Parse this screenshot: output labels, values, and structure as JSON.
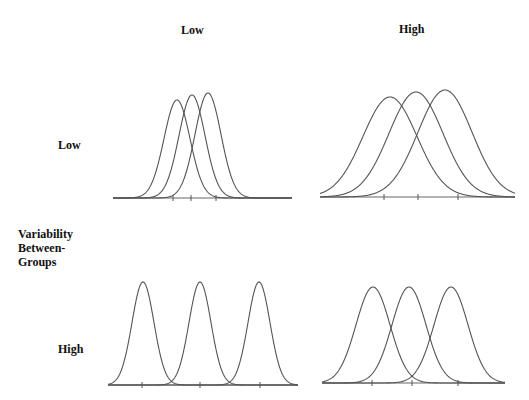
{
  "column_header": {
    "title": "Variability Within-Groups (implied)",
    "low": "Low",
    "high": "High"
  },
  "row_header": {
    "title_lines": [
      "Variability",
      "Between-",
      "Groups"
    ],
    "low": "Low",
    "high": "High"
  },
  "panels": [
    {
      "id": "low-between-low-within",
      "row": "Low",
      "col": "Low",
      "baseline_y": 198,
      "x_range": [
        113,
        292
      ],
      "peak_y": [
        100,
        95,
        93
      ],
      "means": [
        177,
        192,
        208
      ],
      "sigma": 13,
      "ticks": [
        173,
        191,
        216
      ]
    },
    {
      "id": "low-between-high-within",
      "row": "Low",
      "col": "High",
      "baseline_y": 197,
      "x_range": [
        320,
        515
      ],
      "peak_y": [
        97,
        92,
        90
      ],
      "means": [
        390,
        416,
        445
      ],
      "sigma": 27,
      "ticks": [
        384,
        418,
        458
      ]
    },
    {
      "id": "high-between-low-within",
      "row": "High",
      "col": "Low",
      "baseline_y": 385,
      "x_range": [
        108,
        298
      ],
      "peak_y": [
        282,
        282,
        282
      ],
      "means": [
        143,
        200,
        259
      ],
      "sigma": 11,
      "ticks": [
        142,
        200,
        260
      ]
    },
    {
      "id": "high-between-high-within",
      "row": "High",
      "col": "High",
      "baseline_y": 383,
      "x_range": [
        322,
        505
      ],
      "peak_y": [
        287,
        287,
        287
      ],
      "means": [
        373,
        409,
        451
      ],
      "sigma": 17,
      "ticks": [
        372,
        412,
        458
      ]
    }
  ],
  "colors": {
    "curve": "#555555",
    "background": "#ffffff",
    "text": "#111111"
  }
}
